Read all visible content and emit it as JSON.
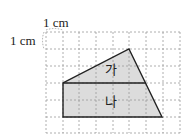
{
  "diagram": {
    "unit_label_horizontal": "1 cm",
    "unit_label_vertical": "1 cm",
    "grid": {
      "columns": 8,
      "rows": 6,
      "line_color": "#9a9a9a"
    },
    "shape_fill": "#dcdcdc",
    "outline_color": "#222222",
    "regions": [
      {
        "id": "ga",
        "label": "가"
      },
      {
        "id": "na",
        "label": "나"
      }
    ]
  }
}
